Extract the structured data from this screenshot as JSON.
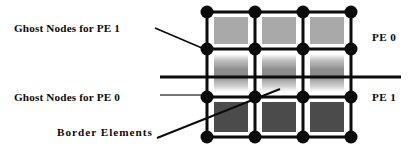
{
  "figure": {
    "type": "mesh-partition-diagram",
    "background": "#ffffff"
  },
  "labels": {
    "ghost_nodes_pe1": "Ghost Nodes for PE 1",
    "ghost_nodes_pe0": "Ghost Nodes for PE 0",
    "border_elements": "Border Elements",
    "pe_top": "PE 0",
    "pe_bottom": "PE 1"
  },
  "colors": {
    "ink": "#0b0b0b",
    "mesh_line": "#0b0b0b",
    "node_fill": "#0b0b0b",
    "element_row_top": "#a9a9a9",
    "element_row_middle_core": "#8c8c8c",
    "element_row_bottom": "#4b4b4b",
    "leader_line": "#0b0b0b",
    "thin_leader_line": "#4a4a4a"
  },
  "mesh": {
    "columns": 3,
    "rows": 3,
    "node_rows": 4,
    "node_columns": 4,
    "node_radius_px": 6.5,
    "line_width_px": 3,
    "x_positions": [
      207,
      255,
      303,
      351
    ],
    "y_positions": [
      12,
      49,
      97,
      137
    ],
    "element_rows": [
      {
        "index": 0,
        "fill": "#a9a9a9",
        "style": "flat-light",
        "belongs_to": "PE 0"
      },
      {
        "index": 1,
        "fill": "#8c8c8c",
        "style": "vertical-gradient-fade",
        "belongs_to": "shared-ghost-band"
      },
      {
        "index": 2,
        "fill": "#4b4b4b",
        "style": "flat-dark",
        "belongs_to": "PE 1"
      }
    ]
  },
  "annotations": {
    "pe_boundary_line": {
      "y": 77,
      "x_start": 160,
      "x_end": 401,
      "width_px": 3
    },
    "leaders": [
      {
        "name": "ghost-pe1-leader",
        "x1": 155,
        "y1": 28,
        "x2": 208,
        "y2": 50,
        "width_px": 1.6
      },
      {
        "name": "ghost-pe0-leader",
        "x1": 160,
        "y1": 95,
        "x2": 207,
        "y2": 95,
        "width_px": 1.2
      },
      {
        "name": "border-elements-leader",
        "x1": 158,
        "y1": 137,
        "x2": 279,
        "y2": 90,
        "width_px": 1.8
      }
    ]
  }
}
